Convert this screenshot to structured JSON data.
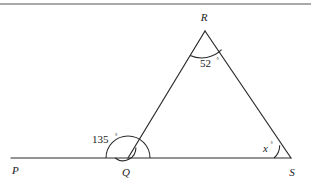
{
  "figure": {
    "kind": "geometry-diagram",
    "background_color": "#ffffff",
    "stroke_color": "#2b2b2b",
    "text_color": "#1a1a1a",
    "top_rule_color": "#8c8c8c",
    "vertices": {
      "p_label": "P",
      "q_label": "Q",
      "r_label": "R",
      "s_label": "S"
    },
    "angles": {
      "at_r_value": "52",
      "at_r_degree": "°",
      "at_q_value": "135",
      "at_q_degree": "°",
      "at_s_value": "x",
      "at_s_degree": "°"
    }
  }
}
